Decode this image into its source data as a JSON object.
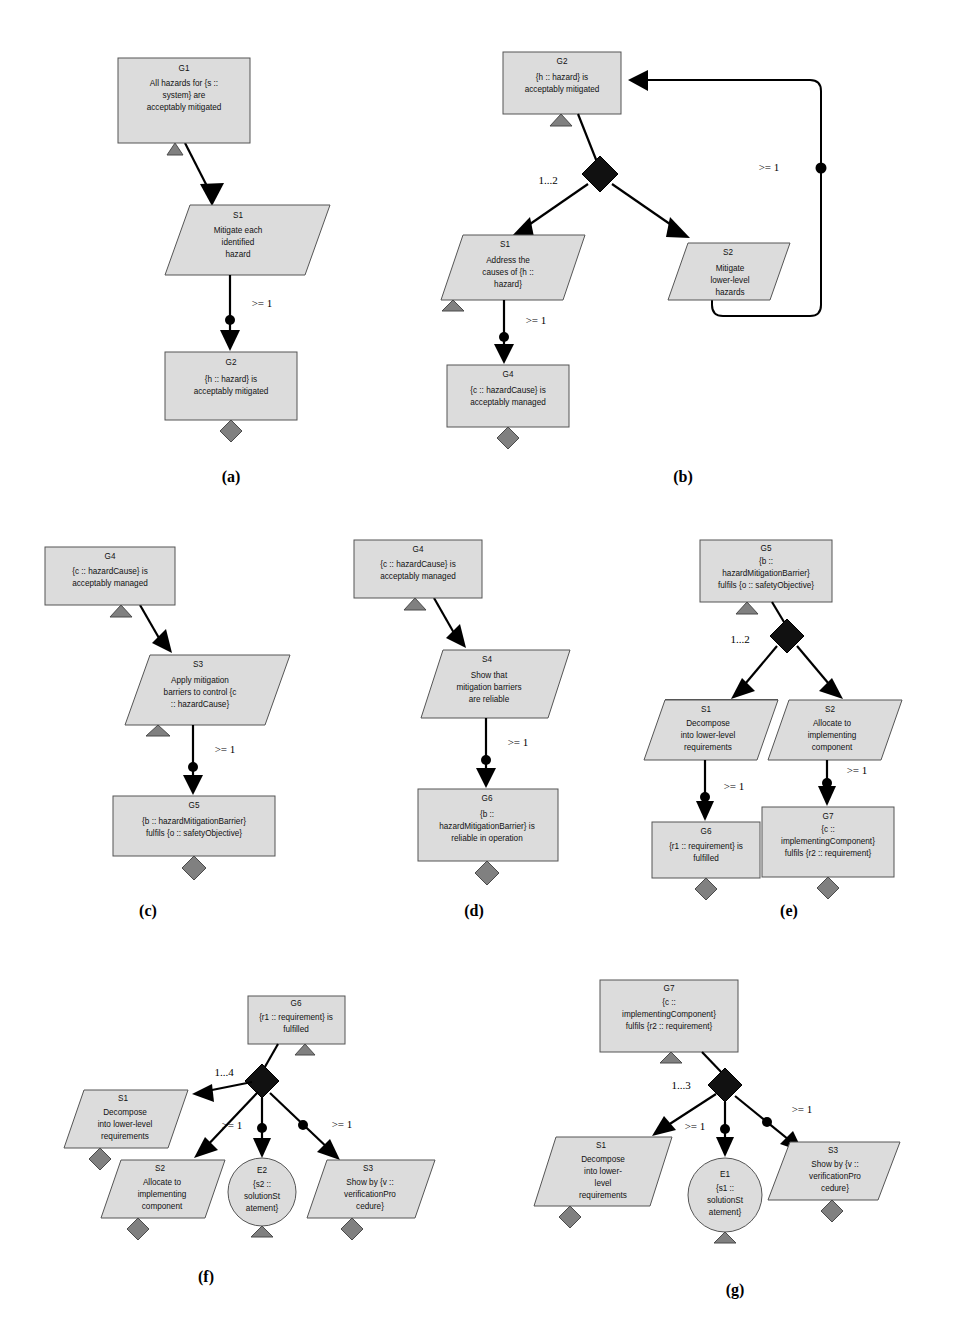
{
  "figure": {
    "type": "gsn-pattern-diagram",
    "background": "#ffffff",
    "node_fill": "#dcdcdc",
    "node_stroke": "#555555",
    "gray_decoration": "#808080",
    "edge_color": "#000000"
  },
  "panels": [
    {
      "key": "a",
      "label": "(a)",
      "nodes": [
        {
          "name": "G1",
          "id": "G1",
          "text": "All hazards for {s :: system} are acceptably mitigated",
          "shape": "goal"
        },
        {
          "name": "S1",
          "id": "S1",
          "text": "Mitigate each identified hazard",
          "shape": "strategy"
        },
        {
          "name": "G2",
          "id": "G2",
          "text": "{h :: hazard} is acceptably mitigated",
          "shape": "goal"
        }
      ],
      "multiplicities": [
        "&gt;= 1"
      ]
    },
    {
      "key": "b",
      "label": "(b)",
      "nodes": [
        {
          "name": "G2",
          "id": "G2",
          "text": "{h :: hazard} is acceptably mitigated",
          "shape": "goal"
        },
        {
          "name": "S1",
          "id": "S1",
          "text": "Address the causes of {h :: hazard}",
          "shape": "strategy"
        },
        {
          "name": "S2",
          "id": "S2",
          "text": "Mitigate lower-level hazards",
          "shape": "strategy"
        },
        {
          "name": "G4",
          "id": "G4",
          "text": "{c :: hazardCause} is acceptably managed",
          "shape": "goal"
        }
      ],
      "multiplicities": [
        "1...2",
        "&gt;= 1",
        "&gt;= 1"
      ]
    },
    {
      "key": "c",
      "label": "(c)",
      "nodes": [
        {
          "name": "G4",
          "id": "G4",
          "text": "{c :: hazardCause} is acceptably managed",
          "shape": "goal"
        },
        {
          "name": "S3",
          "id": "S3",
          "text": "Apply mitigation barriers to control {c :: hazardCause}",
          "shape": "strategy"
        },
        {
          "name": "G5",
          "id": "G5",
          "text": "{b :: hazardMitigationBarrier} fulfils {o :: safetyObjective}",
          "shape": "goal"
        }
      ],
      "multiplicities": [
        "&gt;= 1"
      ]
    },
    {
      "key": "d",
      "label": "(d)",
      "nodes": [
        {
          "name": "G4",
          "id": "G4",
          "text": "{c :: hazardCause} is acceptably managed",
          "shape": "goal"
        },
        {
          "name": "S4",
          "id": "S4",
          "text": "Show that mitigation barriers are reliable",
          "shape": "strategy"
        },
        {
          "name": "G6",
          "id": "G6",
          "text": "{b :: hazardMitigationBarrier} is reliable in operation",
          "shape": "goal"
        }
      ],
      "multiplicities": [
        "&gt;= 1"
      ]
    },
    {
      "key": "e",
      "label": "(e)",
      "nodes": [
        {
          "name": "G5",
          "id": "G5",
          "text": "{b :: hazardMitigationBarrier} fulfils {o :: safetyObjective}",
          "shape": "goal"
        },
        {
          "name": "S1",
          "id": "S1",
          "text": "Decompose into lower-level requirements",
          "shape": "strategy"
        },
        {
          "name": "S2",
          "id": "S2",
          "text": "Allocate to implementing component",
          "shape": "strategy"
        },
        {
          "name": "G6",
          "id": "G6",
          "text": "{r1 :: requirement} is fulfilled",
          "shape": "goal"
        },
        {
          "name": "G7",
          "id": "G7",
          "text": "{c :: implementingComponent} fulfils {r2 :: requirement}",
          "shape": "goal"
        }
      ],
      "multiplicities": [
        "1...2",
        "&gt;= 1",
        "&gt;= 1"
      ]
    },
    {
      "key": "f",
      "label": "(f)",
      "nodes": [
        {
          "name": "G6",
          "id": "G6",
          "text": "{r1 :: requirement} is fulfilled",
          "shape": "goal"
        },
        {
          "name": "S1",
          "id": "S1",
          "text": "Decompose into lower-level requirements",
          "shape": "strategy"
        },
        {
          "name": "S2",
          "id": "S2",
          "text": "Allocate to implementing component",
          "shape": "strategy"
        },
        {
          "name": "E2",
          "id": "E2",
          "text": "{s2 :: solutionStatement}",
          "shape": "solution"
        },
        {
          "name": "S3",
          "id": "S3",
          "text": "Show by {v :: verificationProcedure}",
          "shape": "strategy"
        }
      ],
      "multiplicities": [
        "1...4",
        "&gt;= 1",
        "&gt;= 1"
      ]
    },
    {
      "key": "g",
      "label": "(g)",
      "nodes": [
        {
          "name": "G7",
          "id": "G7",
          "text": "{c :: implementingComponent} fulfils {r2 :: requirement}",
          "shape": "goal"
        },
        {
          "name": "S1",
          "id": "S1",
          "text": "Decompose into lower-level requirements",
          "shape": "strategy"
        },
        {
          "name": "E1",
          "id": "E1",
          "text": "{s1 :: solutionStatement}",
          "shape": "solution"
        },
        {
          "name": "S3",
          "id": "S3",
          "text": "Show by {v :: verificationProcedure}",
          "shape": "strategy"
        }
      ],
      "multiplicities": [
        "1...3",
        "&gt;= 1",
        "&gt;= 1"
      ]
    }
  ],
  "text": {
    "a": {
      "g1_id": "G1",
      "g1_l1": "All hazards for {s ::",
      "g1_l2": "system} are",
      "g1_l3": "acceptably mitigated",
      "s1_id": "S1",
      "s1_l1": "Mitigate each",
      "s1_l2": "identified",
      "s1_l3": "hazard",
      "g2_id": "G2",
      "g2_l1": "{h :: hazard} is",
      "g2_l2": "acceptably mitigated",
      "m1": ">= 1",
      "panel": "(a)"
    },
    "b": {
      "g2_id": "G2",
      "g2_l1": "{h :: hazard} is",
      "g2_l2": "acceptably mitigated",
      "s1_id": "S1",
      "s1_l1": "Address the",
      "s1_l2": "causes of {h ::",
      "s1_l3": "hazard}",
      "s2_id": "S2",
      "s2_l1": "Mitigate",
      "s2_l2": "lower-level",
      "s2_l3": "hazards",
      "g4_id": "G4",
      "g4_l1": "{c :: hazardCause} is",
      "g4_l2": "acceptably managed",
      "m_fork": "1...2",
      "m_loop": ">= 1",
      "m_g4": ">= 1",
      "panel": "(b)"
    },
    "c": {
      "g4_id": "G4",
      "g4_l1": "{c :: hazardCause} is",
      "g4_l2": "acceptably managed",
      "s3_id": "S3",
      "s3_l1": "Apply mitigation",
      "s3_l2": "barriers to control {c",
      "s3_l3": ":: hazardCause}",
      "g5_id": "G5",
      "g5_l1": "{b :: hazardMitigationBarrier}",
      "g5_l2": "fulfils {o :: safetyObjective}",
      "m1": ">= 1",
      "panel": "(c)"
    },
    "d": {
      "g4_id": "G4",
      "g4_l1": "{c :: hazardCause} is",
      "g4_l2": "acceptably managed",
      "s4_id": "S4",
      "s4_l1": "Show that",
      "s4_l2": "mitigation barriers",
      "s4_l3": "are reliable",
      "g6_id": "G6",
      "g6_l1": "{b ::",
      "g6_l2": "hazardMitigationBarrier} is",
      "g6_l3": "reliable in operation",
      "m1": ">= 1",
      "panel": "(d)"
    },
    "e": {
      "g5_id": "G5",
      "g5_l1": "{b ::",
      "g5_l2": "hazardMitigationBarrier}",
      "g5_l3": "fulfils {o :: safetyObjective}",
      "s1_id": "S1",
      "s1_l1": "Decompose",
      "s1_l2": "into lower-level",
      "s1_l3": "requirements",
      "s2_id": "S2",
      "s2_l1": "Allocate to",
      "s2_l2": "implementing",
      "s2_l3": "component",
      "g6_id": "G6",
      "g6_l1": "{r1 :: requirement} is",
      "g6_l2": "fulfilled",
      "g7_id": "G7",
      "g7_l1": "{c ::",
      "g7_l2": "implementingComponent}",
      "g7_l3": "fulfils {r2 :: requirement}",
      "m_fork": "1...2",
      "m_left": ">= 1",
      "m_right": ">= 1",
      "panel": "(e)"
    },
    "f": {
      "g6_id": "G6",
      "g6_l1": "{r1 :: requirement} is",
      "g6_l2": "fulfilled",
      "s1_id": "S1",
      "s1_l1": "Decompose",
      "s1_l2": "into lower-level",
      "s1_l3": "requirements",
      "s2_id": "S2",
      "s2_l1": "Allocate to",
      "s2_l2": "implementing",
      "s2_l3": "component",
      "e2_id": "E2",
      "e2_l1": "{s2 ::",
      "e2_l2": "solutionSt",
      "e2_l3": "atement}",
      "s3_id": "S3",
      "s3_l1": "Show by {v ::",
      "s3_l2": "verificationPro",
      "s3_l3": "cedure}",
      "m_fork": "1...4",
      "m_mid": ">= 1",
      "m_right": ">= 1",
      "panel": "(f)"
    },
    "g": {
      "g7_id": "G7",
      "g7_l1": "{c ::",
      "g7_l2": "implementingComponent}",
      "g7_l3": "fulfils {r2 :: requirement}",
      "s1_id": "S1",
      "s1_l1": "Decompose",
      "s1_l2": "into lower-",
      "s1_l3": "level",
      "s1_l4": "requirements",
      "e1_id": "E1",
      "e1_l1": "{s1 ::",
      "e1_l2": "solutionSt",
      "e1_l3": "atement}",
      "s3_id": "S3",
      "s3_l1": "Show by {v ::",
      "s3_l2": "verificationPro",
      "s3_l3": "cedure}",
      "m_fork": "1...3",
      "m_mid": ">= 1",
      "m_right": ">= 1",
      "panel": "(g)"
    }
  }
}
